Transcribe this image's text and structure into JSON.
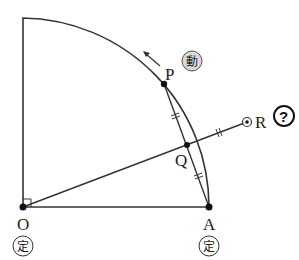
{
  "diagram": {
    "type": "geometry",
    "points": {
      "O": {
        "label": "O",
        "badge": "定",
        "x": 23,
        "y": 207
      },
      "A": {
        "label": "A",
        "badge": "定",
        "x": 209,
        "y": 207
      },
      "P": {
        "label": "P",
        "badge": "動",
        "x": 164,
        "y": 84
      },
      "Q": {
        "label": "Q",
        "x": 187,
        "y": 145
      },
      "R": {
        "label": "R",
        "badge": "?",
        "x": 247,
        "y": 122
      }
    },
    "colors": {
      "stroke": "#333333",
      "badge_fill": "#d9d9d9"
    }
  }
}
